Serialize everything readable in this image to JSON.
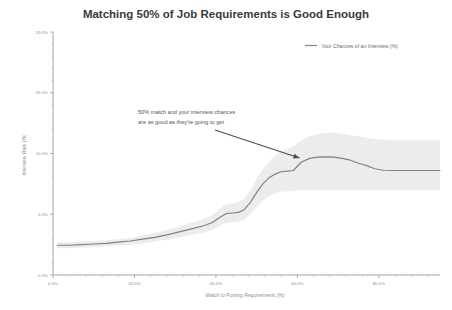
{
  "chart_data": {
    "type": "line",
    "title": "Matching 50% of Job Requirements is Good Enough",
    "xlabel": "Match to Posting Requirements (%)",
    "ylabel": "Interview Rate (%)",
    "xlim": [
      0,
      95
    ],
    "ylim": [
      0,
      20
    ],
    "grid": false,
    "legend_position": "top-right",
    "legend": [
      "Your Chances of an Interview (%)"
    ],
    "xtick_labels": [
      "0.0%",
      "20.0%",
      "40.0%",
      "60.0%",
      "80.0%"
    ],
    "xtick_values": [
      0,
      20,
      40,
      60,
      80
    ],
    "ytick_labels": [
      "0.0%",
      "5.0%",
      "10.0%",
      "15.0%",
      "20.0%"
    ],
    "ytick_values": [
      0,
      5,
      10,
      15,
      20
    ],
    "series": [
      {
        "name": "Your Chances of an Interview (%)",
        "x": [
          1,
          4,
          7,
          10,
          13,
          16,
          19,
          22,
          25,
          28,
          31,
          34,
          37,
          39,
          41,
          42.5,
          44,
          45.5,
          47,
          48.5,
          50,
          51.5,
          53,
          54.5,
          56,
          57.5,
          59,
          61,
          63,
          65,
          67,
          69,
          71,
          73,
          75,
          77,
          79,
          81,
          83,
          86,
          89,
          92,
          95
        ],
        "values": [
          2.45,
          2.45,
          2.5,
          2.55,
          2.6,
          2.7,
          2.8,
          2.95,
          3.1,
          3.3,
          3.55,
          3.8,
          4.05,
          4.3,
          4.75,
          5.05,
          5.1,
          5.15,
          5.4,
          6.0,
          6.8,
          7.5,
          8.0,
          8.3,
          8.5,
          8.55,
          8.6,
          9.3,
          9.6,
          9.7,
          9.72,
          9.7,
          9.6,
          9.45,
          9.2,
          9.0,
          8.75,
          8.62,
          8.6,
          8.6,
          8.6,
          8.6,
          8.6
        ],
        "band_lower": [
          2.2,
          2.2,
          2.25,
          2.3,
          2.35,
          2.45,
          2.5,
          2.6,
          2.75,
          2.9,
          3.1,
          3.3,
          3.5,
          3.7,
          4.05,
          4.3,
          4.35,
          4.4,
          4.55,
          5.0,
          5.6,
          6.1,
          6.5,
          6.7,
          6.85,
          6.9,
          6.9,
          7.0,
          7.0,
          7.0,
          7.0,
          7.0,
          7.0,
          7.0,
          7.0,
          7.0,
          7.0,
          7.0,
          7.0,
          7.0,
          7.0,
          7.0,
          7.0
        ],
        "band_upper": [
          2.7,
          2.7,
          2.75,
          2.8,
          2.85,
          2.95,
          3.05,
          3.25,
          3.45,
          3.7,
          4.0,
          4.3,
          4.6,
          4.9,
          5.45,
          5.8,
          5.9,
          6.0,
          6.3,
          7.0,
          7.9,
          8.7,
          9.3,
          9.8,
          10.2,
          10.4,
          10.6,
          11.1,
          11.4,
          11.6,
          11.7,
          11.7,
          11.6,
          11.5,
          11.4,
          11.3,
          11.2,
          11.15,
          11.1,
          11.1,
          11.1,
          11.1,
          11.1
        ]
      }
    ],
    "annotations": [
      {
        "line1": "50% match and your interview chances",
        "line2": "are as good as they're going to get",
        "points_to_x": 61,
        "points_to_y": 9.3
      }
    ]
  }
}
